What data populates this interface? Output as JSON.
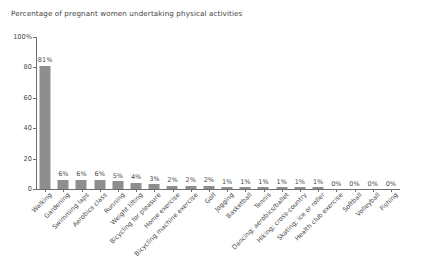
{
  "chart_data": {
    "type": "bar",
    "title": "Percentage of pregnant women undertaking physical activities",
    "xlabel": "",
    "ylabel": "",
    "ylim": [
      0,
      100
    ],
    "yticks": [
      0,
      20,
      40,
      60,
      80,
      100
    ],
    "ytick_labels": [
      "0",
      "20",
      "40",
      "60",
      "80",
      "100%"
    ],
    "grid": false,
    "legend": "none",
    "value_suffix": "%",
    "bar_color": "#8e8e8e",
    "axis_color": "#6e6e6e",
    "text_color": "#4a4a4a",
    "categories": [
      "Walking",
      "Gardening",
      "Swimming laps",
      "Aerobics class",
      "Running",
      "Weight lifting",
      "Bicycling for pleasure",
      "Home exercise",
      "Bicycling machine exercise",
      "Golf",
      "Jogging",
      "Basketball",
      "Tennis",
      "Dancing; aerobics/ballet",
      "Hiking; cross-country",
      "Skating; ice or roller",
      "Health club exercise",
      "Softball",
      "Volleyball",
      "Fishing"
    ],
    "values": [
      81,
      6,
      6,
      6,
      5,
      4,
      3,
      2,
      2,
      2,
      1,
      1,
      1,
      1,
      1,
      1,
      0,
      0,
      0,
      0
    ],
    "value_labels": [
      "81%",
      "6%",
      "6%",
      "6%",
      "5%",
      "4%",
      "3%",
      "2%",
      "2%",
      "2%",
      "1%",
      "1%",
      "1%",
      "1%",
      "1%",
      "1%",
      "0%",
      "0%",
      "0%",
      "0%"
    ]
  }
}
